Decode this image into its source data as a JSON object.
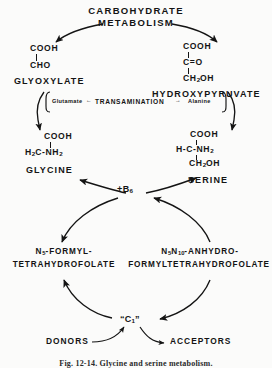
{
  "figure": {
    "title_lines": [
      "CARBOHYDRATE",
      "METABOLISM"
    ],
    "caption": "Fig. 12-14. Glycine and serine metabolism.",
    "background_color": "#fbfbfa",
    "ink_color": "#141414"
  },
  "compounds": {
    "glyoxylate": {
      "name": "GLYOXYLATE",
      "structure_lines": [
        "COOH",
        "CHO"
      ]
    },
    "hydroxypyruvate": {
      "name": "HYDROXYPYRUVATE",
      "structure_lines": [
        "COOH",
        "C=O",
        "CH2OH"
      ]
    },
    "glycine": {
      "name": "GLYCINE",
      "structure_lines": [
        "COOH",
        "H2C-NH2"
      ]
    },
    "serine": {
      "name": "SERINE",
      "structure_lines": [
        "COOH",
        "H-C-NH2",
        "CH2OH"
      ]
    }
  },
  "transamination": {
    "left_product": "Glutamate",
    "center_label": "TRANSAMINATION",
    "right_product": "Alanine",
    "left_arrow": "←",
    "right_arrow": "→"
  },
  "cofactor": {
    "label": "+B",
    "subscript": "6"
  },
  "folates": {
    "left": {
      "line1_prefix": "N",
      "line1_subscript": "5",
      "line1_suffix": "-FORMYL-",
      "line2": "TETRAHYDROFOLATE"
    },
    "right": {
      "line1_prefix": "N",
      "line1_sub_a": "5",
      "line1_mid": "N",
      "line1_sub_b": "10",
      "line1_suffix": "-ANHYDRO-",
      "line2": "FORMYLTETRAHYDROFOLATE"
    }
  },
  "one_carbon_pool": {
    "label_open_quote": "“",
    "label": "C",
    "label_subscript": "1",
    "label_close_quote": "”",
    "donors": "DONORS",
    "acceptors": "ACCEPTORS"
  }
}
